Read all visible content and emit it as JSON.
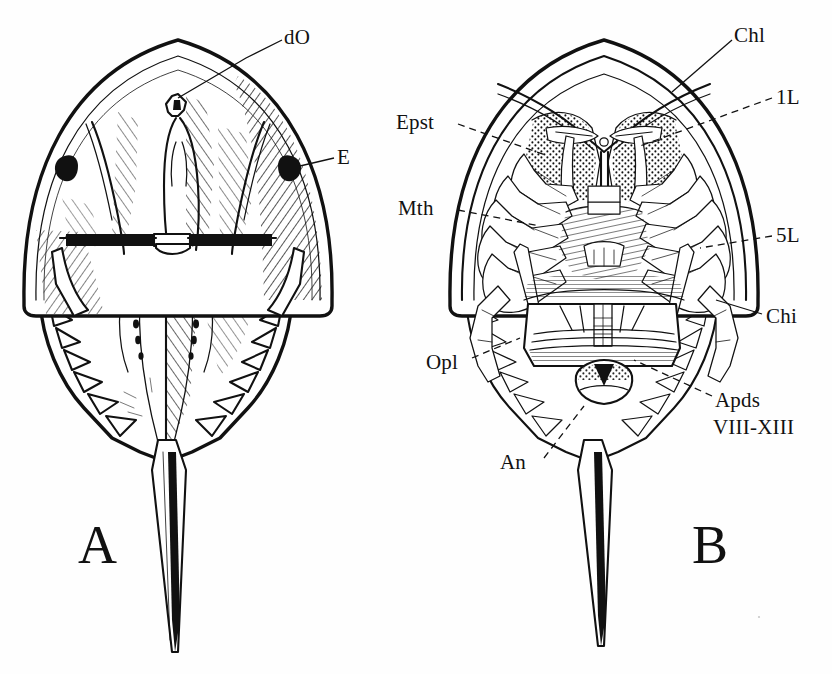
{
  "figure": {
    "background_color": "#fefefe",
    "ink_color": "#111111",
    "width": 832,
    "height": 674
  },
  "panels": [
    {
      "id": "A",
      "letter": "A",
      "view": "dorsal",
      "letter_x": 78,
      "letter_y": 518
    },
    {
      "id": "B",
      "letter": "B",
      "view": "ventral",
      "letter_x": 692,
      "letter_y": 518
    }
  ],
  "labels": [
    {
      "id": "dO",
      "text": "dO",
      "panel": "A",
      "x": 284,
      "y": 26,
      "leader": "solid"
    },
    {
      "id": "E",
      "text": "E",
      "panel": "A",
      "x": 337,
      "y": 146,
      "leader": "solid"
    },
    {
      "id": "Chl",
      "text": "Chl",
      "panel": "B",
      "x": 734,
      "y": 24,
      "leader": "solid"
    },
    {
      "id": "1L",
      "text": "1L",
      "panel": "B",
      "x": 776,
      "y": 86,
      "leader": "dashed"
    },
    {
      "id": "Epst",
      "text": "Epst",
      "panel": "B",
      "x": 396,
      "y": 111,
      "leader": "dashed"
    },
    {
      "id": "Mth",
      "text": "Mth",
      "panel": "B",
      "x": 398,
      "y": 197,
      "leader": "dashed"
    },
    {
      "id": "5L",
      "text": "5L",
      "panel": "B",
      "x": 776,
      "y": 224,
      "leader": "dashed"
    },
    {
      "id": "Chi",
      "text": "Chi",
      "panel": "B",
      "x": 766,
      "y": 305,
      "leader": "solid"
    },
    {
      "id": "Opl",
      "text": "Opl",
      "panel": "B",
      "x": 426,
      "y": 351,
      "leader": "dashed"
    },
    {
      "id": "An",
      "text": "An",
      "panel": "B",
      "x": 500,
      "y": 451,
      "leader": "dashed"
    },
    {
      "id": "Apds",
      "text": "Apds",
      "panel": "B",
      "x": 715,
      "y": 389,
      "leader": "dashed"
    },
    {
      "id": "VIII-XIII",
      "text": "VIII-XIII",
      "panel": "B",
      "x": 713,
      "y": 416,
      "leader": "none"
    }
  ],
  "legend_meanings": {
    "dO": "dorsal ocellus",
    "E": "compound eye",
    "Chl": "chelicera",
    "1L": "first walking leg",
    "Epst": "epistome",
    "Mth": "mouth",
    "5L": "fifth walking leg",
    "Chi": "chilaria",
    "Opl": "opisthosomal lateral spine",
    "An": "anus",
    "Apds": "appendages",
    "VIII-XIII": "segments eight to thirteen"
  }
}
